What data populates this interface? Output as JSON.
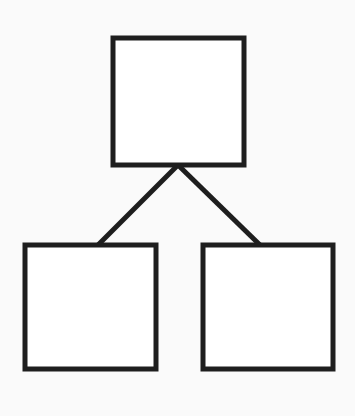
{
  "diagram": {
    "type": "tree",
    "stroke_color": "#1e1e1e",
    "background": "#fafafa",
    "nodes": [
      {
        "id": "root",
        "x": 113,
        "y": 38,
        "w": 131,
        "h": 127
      },
      {
        "id": "child-left",
        "x": 25,
        "y": 245,
        "w": 131,
        "h": 124
      },
      {
        "id": "child-right",
        "x": 203,
        "y": 245,
        "w": 130,
        "h": 124
      }
    ],
    "edges": [
      {
        "from": "root",
        "to": "child-left",
        "x1": 178,
        "y1": 165,
        "x2": 98,
        "y2": 245
      },
      {
        "from": "root",
        "to": "child-right",
        "x1": 178,
        "y1": 165,
        "x2": 260,
        "y2": 245
      }
    ]
  }
}
